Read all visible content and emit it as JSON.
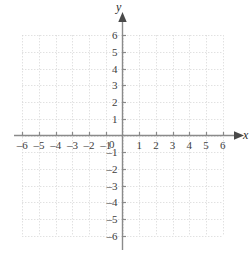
{
  "chart_data": {
    "type": "scatter",
    "title": "",
    "subtitle": "",
    "xlabel": "x",
    "ylabel": "y",
    "xlim": [
      -6,
      6
    ],
    "ylim": [
      -6,
      6
    ],
    "grid": true,
    "grid_style": "dotted",
    "legend": null,
    "series": [],
    "annotations": [],
    "x_tick_values": [
      -6,
      -5,
      -4,
      -3,
      -2,
      -1,
      0,
      1,
      2,
      3,
      4,
      5,
      6
    ],
    "y_tick_values": [
      6,
      5,
      4,
      3,
      2,
      1,
      -1,
      -2,
      -3,
      -4,
      -5,
      -6
    ],
    "origin_label": "0",
    "x_tick_labels": [
      "–6",
      "–5",
      "–4",
      "–3",
      "–2",
      "–1",
      "1",
      "2",
      "3",
      "4",
      "5",
      "6"
    ],
    "y_tick_labels": [
      "6",
      "5",
      "4",
      "3",
      "2",
      "1",
      "–1",
      "–2",
      "–3",
      "–4",
      "–5",
      "–6"
    ],
    "colors": {
      "grid": "#d4d4d4",
      "axis": "#8a8a8a",
      "text": "#3d3d3d",
      "background": "#ffffff"
    },
    "arrowheads": {
      "x_positive": true,
      "y_positive": true,
      "x_negative": false,
      "y_negative": false
    }
  },
  "figure": {
    "x_axis_name": "x",
    "y_axis_name": "y",
    "origin_label": "0"
  }
}
